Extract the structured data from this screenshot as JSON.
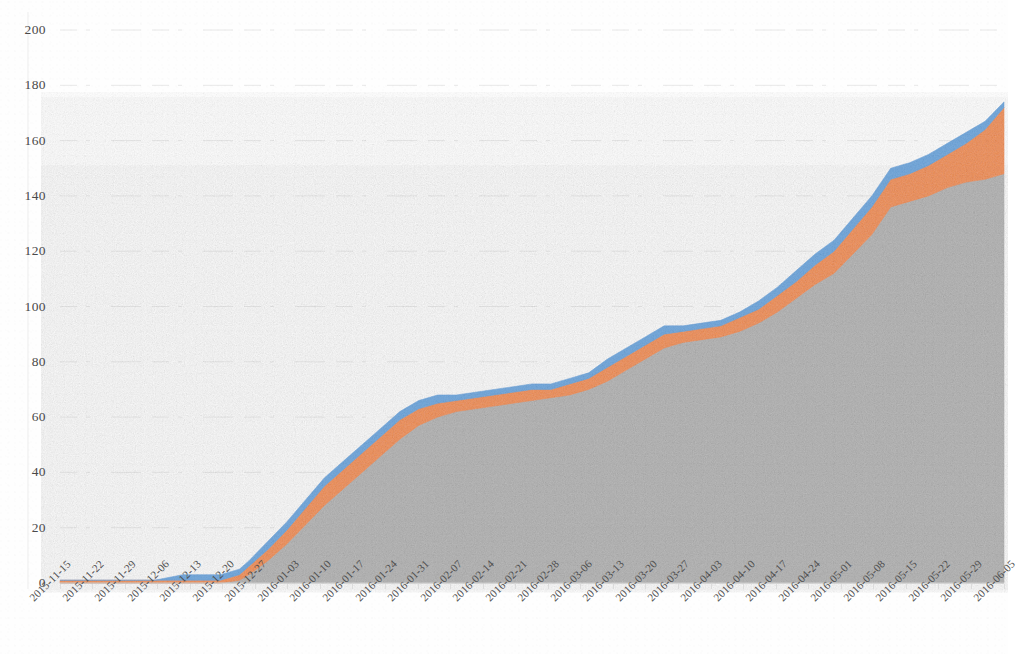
{
  "chart_data": {
    "type": "area",
    "title": "",
    "subtitle": "",
    "xlabel": "",
    "ylabel": "",
    "stacked": true,
    "grid": true,
    "legend": "none",
    "ylim": [
      0,
      200
    ],
    "yticks": [
      0,
      20,
      40,
      60,
      80,
      100,
      120,
      140,
      160,
      180,
      200
    ],
    "categories": [
      "2015-11-15",
      "2015-11-22",
      "2015-11-29",
      "2015-12-06",
      "2015-12-13",
      "2015-12-20",
      "2015-12-27",
      "2016-01-03",
      "2016-01-10",
      "2016-01-17",
      "2016-01-24",
      "2016-01-31",
      "2016-02-07",
      "2016-02-14",
      "2016-02-21",
      "2016-02-28",
      "2016-03-06",
      "2016-03-13",
      "2016-03-20",
      "2016-03-27",
      "2016-04-03",
      "2016-04-10",
      "2016-04-17",
      "2016-04-24",
      "2016-05-01",
      "2016-05-08",
      "2016-05-15",
      "2016-05-22",
      "2016-05-29",
      "2016-06-05"
    ],
    "colors": {
      "series_gray": "#a5a5a5",
      "series_orange": "#ed7d31",
      "series_blue": "#5b9bd5",
      "gridline": "#e4e4e4",
      "axis_text": "#4a4a4a",
      "background": "#fefefe"
    },
    "series": [
      {
        "name": "Series 1",
        "color": "#a5a5a5",
        "values": [
          0,
          0,
          0,
          0,
          0,
          0,
          0,
          1,
          6,
          16,
          26,
          35,
          45,
          54,
          60,
          62,
          64,
          66,
          68,
          71,
          79,
          86,
          88,
          90,
          96,
          104,
          113,
          134,
          140,
          147
        ]
      },
      {
        "name": "Series 2",
        "color": "#ed7d31",
        "values": [
          1,
          1,
          1,
          1,
          1,
          1,
          1,
          2,
          4,
          5,
          6,
          7,
          7,
          7,
          5,
          4,
          4,
          4,
          3,
          4,
          5,
          5,
          4,
          4,
          5,
          6,
          7,
          10,
          10,
          22
        ]
      },
      {
        "name": "Series 3",
        "color": "#5b9bd5",
        "values": [
          0,
          0,
          0,
          0,
          2,
          2,
          2,
          2,
          3,
          3,
          3,
          3,
          3,
          3,
          3,
          2,
          2,
          2,
          2,
          2,
          3,
          3,
          2,
          2,
          2,
          3,
          4,
          4,
          4,
          3
        ]
      }
    ],
    "totals": [
      1,
      1,
      1,
      1,
      3,
      3,
      3,
      5,
      13,
      24,
      35,
      45,
      55,
      64,
      68,
      68,
      70,
      72,
      73,
      77,
      87,
      94,
      94,
      96,
      103,
      113,
      124,
      148,
      154,
      172
    ],
    "detail_points": {
      "note": "Fine-grained daily sampled cumulative totals read from the plotted curve",
      "x_fraction": [
        0.0,
        0.03,
        0.07,
        0.1,
        0.13,
        0.16,
        0.17,
        0.19,
        0.2,
        0.22,
        0.24,
        0.26,
        0.28,
        0.3,
        0.32,
        0.34,
        0.36,
        0.38,
        0.4,
        0.42,
        0.44,
        0.46,
        0.48,
        0.5,
        0.52,
        0.54,
        0.56,
        0.58,
        0.6,
        0.62,
        0.64,
        0.66,
        0.68,
        0.7,
        0.72,
        0.74,
        0.76,
        0.78,
        0.8,
        0.82,
        0.84,
        0.86,
        0.88,
        0.9,
        0.92,
        0.94,
        0.96,
        0.98,
        1.0
      ],
      "gray": [
        0,
        0,
        0,
        0,
        0,
        0,
        0,
        1,
        3,
        8,
        14,
        21,
        28,
        34,
        40,
        46,
        52,
        57,
        60,
        62,
        63,
        64,
        65,
        66,
        67,
        68,
        70,
        73,
        77,
        81,
        85,
        87,
        88,
        89,
        91,
        94,
        98,
        103,
        108,
        112,
        119,
        126,
        136,
        138,
        140,
        143,
        145,
        146,
        148
      ],
      "orange": [
        1,
        1,
        1,
        1,
        1,
        1,
        1,
        2,
        3,
        4,
        5,
        6,
        7,
        7,
        7,
        7,
        7,
        6,
        5,
        4,
        4,
        4,
        4,
        4,
        3,
        4,
        4,
        5,
        5,
        5,
        5,
        4,
        4,
        4,
        5,
        5,
        6,
        6,
        7,
        8,
        9,
        10,
        10,
        10,
        11,
        12,
        14,
        18,
        24
      ],
      "blue": [
        0,
        0,
        0,
        0,
        2,
        2,
        2,
        2,
        2,
        3,
        3,
        3,
        3,
        3,
        3,
        3,
        3,
        3,
        3,
        2,
        2,
        2,
        2,
        2,
        2,
        2,
        2,
        3,
        3,
        3,
        3,
        2,
        2,
        2,
        2,
        3,
        3,
        4,
        4,
        4,
        4,
        4,
        4,
        4,
        4,
        4,
        4,
        3,
        2
      ]
    }
  }
}
